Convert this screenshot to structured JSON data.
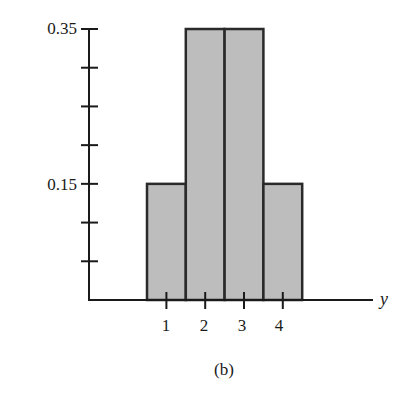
{
  "chart_data": {
    "type": "bar",
    "title": "",
    "caption": "(b)",
    "xlabel": "y",
    "ylabel": "",
    "categories": [
      "1",
      "2",
      "3",
      "4"
    ],
    "values": [
      0.15,
      0.35,
      0.35,
      0.15
    ],
    "ylim": [
      0,
      0.35
    ],
    "yticks": [
      0.05,
      0.1,
      0.15,
      0.2,
      0.25,
      0.3,
      0.35
    ],
    "ytick_labels_shown": [
      "0.15",
      "0.35"
    ],
    "grid": false,
    "legend": null,
    "bar_color": "#bdbdbd",
    "edge_color": "#2a2a2a"
  },
  "labels": {
    "y_high": "0.35",
    "y_low": "0.15",
    "x1": "1",
    "x2": "2",
    "x3": "3",
    "x4": "4",
    "axis_var": "y",
    "caption": "(b)"
  }
}
